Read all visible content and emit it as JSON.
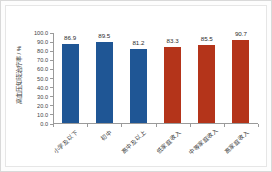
{
  "chart_data": {
    "type": "bar",
    "title": "",
    "xlabel": "",
    "ylabel": "高血压知晓治疗率 / %",
    "ylim": [
      0,
      100
    ],
    "ytick_labels": [
      "100.0",
      "90.0",
      "80.0",
      "70.0",
      "60.0",
      "50.0",
      "40.0",
      "30.0",
      "20.0",
      "10.0",
      "0.0"
    ],
    "ytick_values": [
      100,
      90,
      80,
      70,
      60,
      50,
      40,
      30,
      20,
      10,
      0
    ],
    "grid": false,
    "legend": "none",
    "categories": [
      "小学及以下",
      "初中",
      "高中及以上",
      "低家庭收入",
      "中等家庭收入",
      "高家庭收入"
    ],
    "values": [
      86.9,
      89.5,
      81.2,
      83.3,
      85.5,
      90.7
    ],
    "value_labels": [
      "86.9",
      "89.5",
      "81.2",
      "83.3",
      "85.5",
      "90.7"
    ],
    "bar_colors": [
      "#1F5695",
      "#1F5695",
      "#1F5695",
      "#B4341A",
      "#B4341A",
      "#B4341A"
    ],
    "color_blue": "#1F5695",
    "color_red": "#B4341A"
  }
}
